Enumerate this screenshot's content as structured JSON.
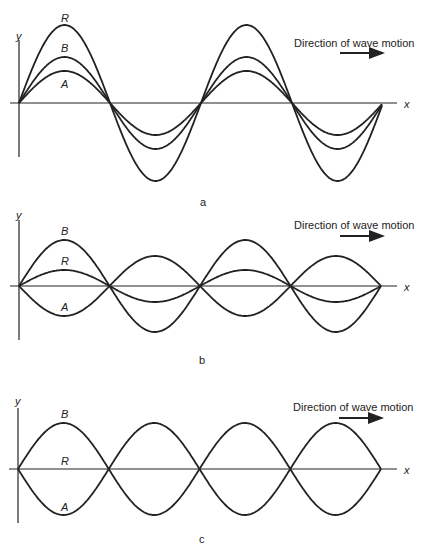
{
  "figure": {
    "direction_label": "Direction of wave motion",
    "axis_x_label": "x",
    "axis_y_label": "y",
    "panels": [
      {
        "caption": "a",
        "description": "Waves A and B in phase; resultant R has larger amplitude (constructive interference)",
        "curve_labels": {
          "R": "R",
          "B": "B",
          "A": "A"
        }
      },
      {
        "caption": "b",
        "description": "Waves A and B partially out of phase; resultant R has reduced amplitude",
        "curve_labels": {
          "B": "B",
          "R": "R",
          "A": "A"
        }
      },
      {
        "caption": "c",
        "description": "Waves A and B completely out of phase; resultant R is zero (destructive interference)",
        "curve_labels": {
          "B": "B",
          "R": "R",
          "A": "A"
        }
      }
    ]
  },
  "chart_data": [
    {
      "type": "line",
      "title": "a",
      "xlabel": "x",
      "ylabel": "y",
      "half_wavelength_px": 91,
      "series": [
        {
          "name": "A",
          "amplitude": 32,
          "phase": 0
        },
        {
          "name": "B",
          "amplitude": 46,
          "phase": 0
        },
        {
          "name": "R",
          "amplitude": 78,
          "phase": 0
        }
      ]
    },
    {
      "type": "line",
      "title": "b",
      "xlabel": "x",
      "ylabel": "y",
      "series": [
        {
          "name": "B",
          "amplitude": 46
        },
        {
          "name": "A",
          "amplitude": -30,
          "note": "inverted, smaller"
        },
        {
          "name": "R",
          "amplitude": 16
        }
      ]
    },
    {
      "type": "line",
      "title": "c",
      "xlabel": "x",
      "ylabel": "y",
      "series": [
        {
          "name": "B",
          "amplitude": 46
        },
        {
          "name": "A",
          "amplitude": -46
        },
        {
          "name": "R",
          "amplitude": 0
        }
      ]
    }
  ]
}
